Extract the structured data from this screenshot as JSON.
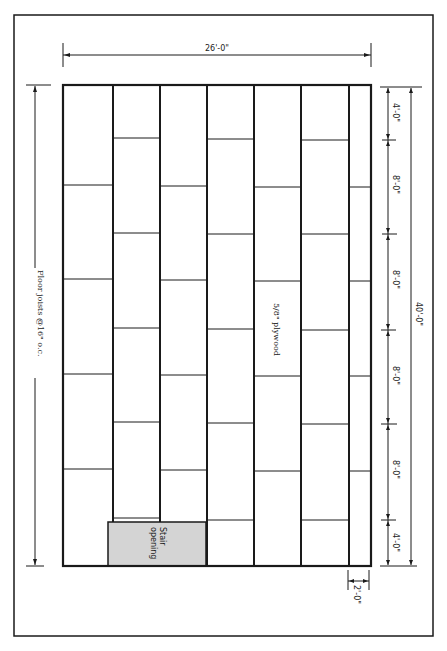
{
  "diagram": {
    "overall_width_label": "26'-0\"",
    "overall_length_label": "40'-0\"",
    "joist_label": "Floor joists @16\" o.c.",
    "panel_label": "5/8\" plywood",
    "stair_label_line1": "Stair",
    "stair_label_line2": "opening",
    "edge_strip_label": "2'-0\"",
    "segment_labels": [
      "4'-0\"",
      "8'-0\"",
      "8'-0\"",
      "8'-0\"",
      "8'-0\"",
      "4'-0\""
    ],
    "colors": {
      "line": "#1a1a1a",
      "stair_fill": "#d4d4d4",
      "background": "#ffffff"
    },
    "columns": [
      {
        "index": 1,
        "width_ft": 4,
        "sheet_joints_ft": [
          8,
          16,
          24,
          32
        ]
      },
      {
        "index": 2,
        "width_ft": 4,
        "sheet_joints_ft": [
          4,
          12,
          20,
          28,
          36
        ]
      },
      {
        "index": 3,
        "width_ft": 4,
        "sheet_joints_ft": [
          8,
          16,
          24,
          32
        ]
      },
      {
        "index": 4,
        "width_ft": 4,
        "sheet_joints_ft": [
          4,
          12,
          20,
          28,
          36
        ]
      },
      {
        "index": 5,
        "width_ft": 4,
        "sheet_joints_ft": [
          8,
          16,
          24,
          32
        ]
      },
      {
        "index": 6,
        "width_ft": 4,
        "sheet_joints_ft": [
          4,
          12,
          20,
          28,
          36
        ]
      },
      {
        "index": 7,
        "width_ft": 2,
        "sheet_joints_ft": [
          8,
          16,
          24,
          32
        ]
      }
    ]
  }
}
